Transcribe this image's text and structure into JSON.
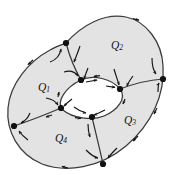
{
  "figure": {
    "background_color": "#ffffff",
    "fill_color": "#e3e3e3",
    "stroke_color": "#3a3a3a",
    "vertex_color": "#111111",
    "label_color": "#111111"
  },
  "regions": [
    {
      "id": "Q1",
      "label": "Q",
      "subscript": "1",
      "cx": 44,
      "cy": 88
    },
    {
      "id": "Q2",
      "label": "Q",
      "subscript": "2",
      "cx": 117,
      "cy": 46
    },
    {
      "id": "Q3",
      "label": "Q",
      "subscript": "3",
      "cx": 130,
      "cy": 121
    },
    {
      "id": "Q4",
      "label": "Q",
      "subscript": "4",
      "cx": 61,
      "cy": 139
    }
  ],
  "vertices": [
    {
      "id": "v-outer-upper-left",
      "x": 66,
      "y": 43
    },
    {
      "id": "v-outer-right",
      "x": 163,
      "y": 79
    },
    {
      "id": "v-outer-bottom",
      "x": 103,
      "y": 164
    },
    {
      "id": "v-outer-left",
      "x": 14,
      "y": 126
    },
    {
      "id": "v-inner-top",
      "x": 81,
      "y": 80
    },
    {
      "id": "v-inner-right",
      "x": 120,
      "y": 89
    },
    {
      "id": "v-inner-bottom",
      "x": 92,
      "y": 117
    },
    {
      "id": "v-inner-left",
      "x": 61,
      "y": 108
    }
  ],
  "edges": [
    {
      "id": "edge-q1-q2",
      "from": "v-outer-upper-left",
      "to": "v-inner-top"
    },
    {
      "id": "edge-q2-q3",
      "from": "v-outer-right",
      "to": "v-inner-right"
    },
    {
      "id": "edge-q3-q4",
      "from": "v-outer-bottom",
      "to": "v-inner-bottom"
    },
    {
      "id": "edge-q4-q1",
      "from": "v-outer-left",
      "to": "v-inner-left"
    }
  ],
  "boundaries": {
    "outer_boundary_id": "outer-boundary",
    "inner_boundary_id": "inner-hole-boundary"
  },
  "flow_arrows": {
    "count": 24,
    "description": "directional flow arrows along edges and boundaries"
  }
}
